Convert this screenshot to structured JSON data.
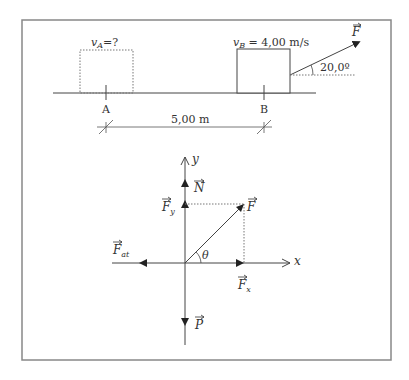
{
  "figure": {
    "top_scene": {
      "label_vA": "v",
      "label_vA_sub": "A",
      "label_vA_rest": "=?",
      "label_vB": "v",
      "label_vB_sub": "B",
      "label_vB_rest": " = 4,00 m/s",
      "force_label": "F",
      "angle_label": "20,0º",
      "point_A": "A",
      "point_B": "B",
      "distance_label": "5,00 m"
    },
    "free_body": {
      "axis_x": "x",
      "axis_y": "y",
      "normal": "N",
      "force_y": "F",
      "force_y_sub": "y",
      "force": "F",
      "friction": "F",
      "friction_sub": "at",
      "theta": "θ",
      "force_x": "F",
      "force_x_sub": "x",
      "weight": "P"
    },
    "colors": {
      "line": "#444444",
      "frame": "#888888",
      "dashed": "#777777"
    }
  }
}
